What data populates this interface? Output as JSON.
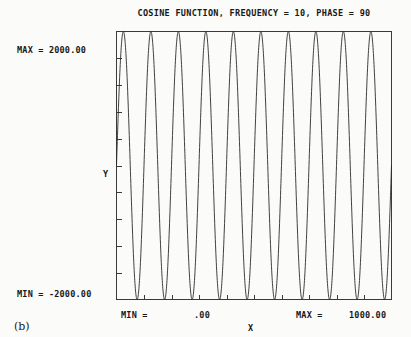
{
  "figure": {
    "caption": "(b)",
    "title": "COSINE FUNCTION, FREQUENCY = 10, PHASE = 90"
  },
  "axes": {
    "y_max_label": "MAX =   2000.00",
    "y_min_label": "MIN =  -2000.00",
    "y_title": "Y",
    "x_title": "X",
    "x_min_label": "MIN =",
    "x_zero_label": ".00",
    "x_max_label": "MAX =",
    "x_max_value": "1000.00"
  },
  "style": {
    "background": "#fbfbf9",
    "ink": "#181818",
    "curve_color": "#2b2b2b",
    "axis_color": "#3a3a3a"
  },
  "chart_data": {
    "type": "line",
    "title": "COSINE FUNCTION, FREQUENCY = 10, PHASE = 90",
    "xlabel": "X",
    "ylabel": "Y",
    "xlim": [
      0,
      1000
    ],
    "ylim": [
      -2000,
      2000
    ],
    "grid": false,
    "legend": null,
    "function": "y = 2000 * cos(2*pi*10*x/1000 - 90 deg)",
    "amplitude": 2000,
    "frequency": 10,
    "phase_deg": 90,
    "x_tick_count": 10,
    "y_tick_count": 10,
    "x_ticks": [
      0,
      100,
      200,
      300,
      400,
      500,
      600,
      700,
      800,
      900,
      1000
    ],
    "y_ticks": [
      -2000,
      -1600,
      -1200,
      -800,
      -400,
      0,
      400,
      800,
      1200,
      1600,
      2000
    ],
    "series": [
      {
        "name": "cosine",
        "x": [
          0,
          25,
          50,
          75,
          100,
          125,
          150,
          175,
          200,
          225,
          250,
          275,
          300,
          325,
          350,
          375,
          400,
          425,
          450,
          475,
          500,
          525,
          550,
          575,
          600,
          625,
          650,
          675,
          700,
          725,
          750,
          775,
          800,
          825,
          850,
          875,
          900,
          925,
          950,
          975,
          1000
        ],
        "y": [
          0,
          2000,
          0,
          -2000,
          0,
          2000,
          0,
          -2000,
          0,
          2000,
          0,
          -2000,
          0,
          2000,
          0,
          -2000,
          0,
          2000,
          0,
          -2000,
          0,
          2000,
          0,
          -2000,
          0,
          2000,
          0,
          -2000,
          0,
          2000,
          0,
          -2000,
          0,
          2000,
          0,
          -2000,
          0,
          2000,
          0,
          -2000,
          0
        ]
      }
    ]
  }
}
